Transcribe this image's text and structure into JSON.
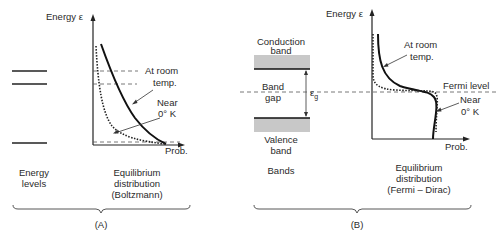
{
  "panel_a": {
    "axis_y_label": "Energy ε",
    "axis_x_label": "Prob.",
    "curve_labels": {
      "room_temp_line1": "At room",
      "room_temp_line2": "temp.",
      "near_zero_line1": "Near",
      "near_zero_line2": "0° K"
    },
    "energy_levels_caption": [
      "Energy",
      "levels"
    ],
    "distribution_caption": [
      "Equilibrium",
      "distribution",
      "(Boltzmann)"
    ],
    "panel_label": "(A)"
  },
  "panel_b": {
    "conduction_band_label": [
      "Conduction",
      "band"
    ],
    "band_gap_label": [
      "Band",
      "gap"
    ],
    "gap_symbol": "ε",
    "gap_subscript": "g",
    "valence_band_label": [
      "Valence",
      "band"
    ],
    "bands_caption": "Bands",
    "axis_y_label": "Energy ε",
    "axis_x_label": "Prob.",
    "fermi_level_label": "Fermi level",
    "curve_labels": {
      "room_temp_line1": "At room",
      "room_temp_line2": "temp.",
      "near_zero_line1": "Near",
      "near_zero_line2": "0° K"
    },
    "distribution_caption": [
      "Equilibrium",
      "distribution",
      "(Fermi – Dirac)"
    ],
    "panel_label": "(B)"
  },
  "colors": {
    "band_fill": "#c8c8c8",
    "line": "#111111",
    "text": "#2a2a2a"
  }
}
